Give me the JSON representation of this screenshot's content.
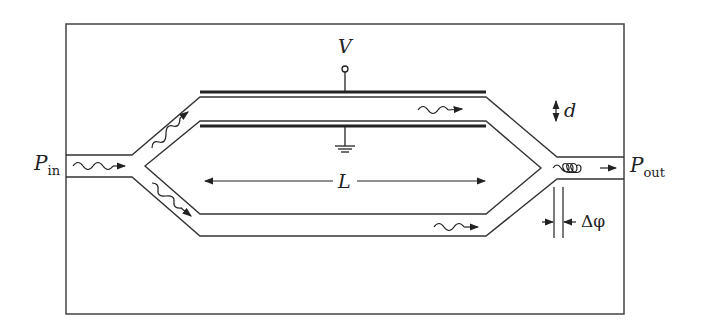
{
  "diagram": {
    "labels": {
      "input_power": "P",
      "input_power_sub": "in",
      "output_power": "P",
      "output_power_sub": "out",
      "voltage": "V",
      "electrode_gap": "d",
      "length": "L",
      "phase_difference": "Δφ"
    },
    "components": [
      "input waveguide",
      "Y-splitter",
      "upper arm with electrodes",
      "lower arm",
      "Y-combiner",
      "output waveguide",
      "voltage terminal",
      "ground"
    ],
    "colors": {
      "line": "#333333",
      "electrode": "#222222",
      "background": "#ffffff"
    }
  }
}
